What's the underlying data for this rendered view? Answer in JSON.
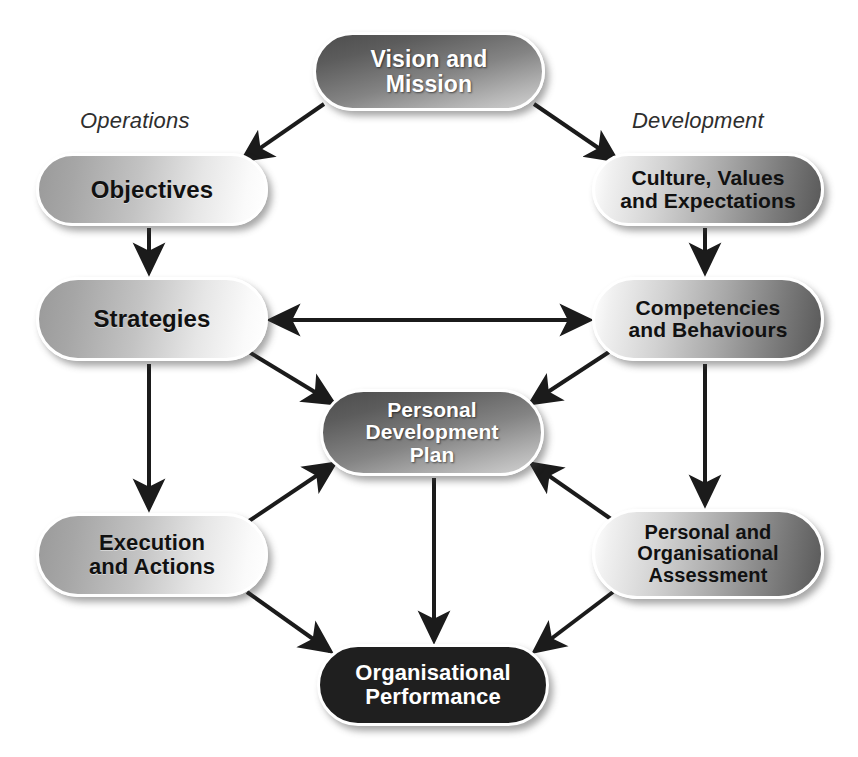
{
  "diagram": {
    "background_color": "#ffffff",
    "labels": {
      "left_column": "Operations",
      "right_column": "Development"
    },
    "nodes": [
      {
        "id": "vision_mission",
        "text": "Vision and\nMission",
        "style": "dark",
        "text_color": "#ffffff",
        "x": 313,
        "y": 32,
        "w": 232,
        "h": 79
      },
      {
        "id": "objectives",
        "text": "Objectives",
        "style": "light",
        "text_color": "#111111",
        "x": 36,
        "y": 153,
        "w": 232,
        "h": 73
      },
      {
        "id": "culture_values",
        "text": "Culture, Values\nand Expectations",
        "style": "light-dark",
        "text_color": "#111111",
        "x": 592,
        "y": 153,
        "w": 232,
        "h": 73
      },
      {
        "id": "strategies",
        "text": "Strategies",
        "style": "light",
        "text_color": "#111111",
        "x": 36,
        "y": 277,
        "w": 232,
        "h": 84
      },
      {
        "id": "competencies",
        "text": "Competencies\nand Behaviours",
        "style": "light-dark",
        "text_color": "#111111",
        "x": 592,
        "y": 277,
        "w": 232,
        "h": 84
      },
      {
        "id": "personal_development_plan",
        "text": "Personal\nDevelopment\nPlan",
        "style": "dark",
        "text_color": "#ffffff",
        "x": 320,
        "y": 389,
        "w": 224,
        "h": 87
      },
      {
        "id": "execution_actions",
        "text": "Execution\nand Actions",
        "style": "light",
        "text_color": "#111111",
        "x": 36,
        "y": 513,
        "w": 232,
        "h": 84
      },
      {
        "id": "personal_org_assessment",
        "text": "Personal and\nOrganisational\nAssessment",
        "style": "light-dark",
        "text_color": "#111111",
        "x": 592,
        "y": 509,
        "w": 232,
        "h": 90
      },
      {
        "id": "organisational_performance",
        "text": "Organisational\nPerformance",
        "style": "darkest",
        "text_color": "#ffffff",
        "x": 317,
        "y": 644,
        "w": 232,
        "h": 82
      }
    ],
    "edges": [
      {
        "id": "vision-to-objectives",
        "from": "vision_mission",
        "to": "objectives",
        "arrow": "single"
      },
      {
        "id": "vision-to-culture",
        "from": "vision_mission",
        "to": "culture_values",
        "arrow": "single"
      },
      {
        "id": "objectives-to-strategies",
        "from": "objectives",
        "to": "strategies",
        "arrow": "single"
      },
      {
        "id": "culture-to-competencies",
        "from": "culture_values",
        "to": "competencies",
        "arrow": "single"
      },
      {
        "id": "strategies-competencies",
        "from": "strategies",
        "to": "competencies",
        "arrow": "double"
      },
      {
        "id": "strategies-to-execution",
        "from": "strategies",
        "to": "execution_actions",
        "arrow": "single"
      },
      {
        "id": "strategies-to-pdp",
        "from": "strategies",
        "to": "personal_development_plan",
        "arrow": "single"
      },
      {
        "id": "competencies-to-pdp",
        "from": "competencies",
        "to": "personal_development_plan",
        "arrow": "single"
      },
      {
        "id": "competencies-to-assessment",
        "from": "competencies",
        "to": "personal_org_assessment",
        "arrow": "single"
      },
      {
        "id": "execution-to-pdp",
        "from": "execution_actions",
        "to": "personal_development_plan",
        "arrow": "single"
      },
      {
        "id": "assessment-to-pdp",
        "from": "personal_org_assessment",
        "to": "personal_development_plan",
        "arrow": "single"
      },
      {
        "id": "execution-to-performance",
        "from": "execution_actions",
        "to": "organisational_performance",
        "arrow": "single"
      },
      {
        "id": "pdp-to-performance",
        "from": "personal_development_plan",
        "to": "organisational_performance",
        "arrow": "single"
      },
      {
        "id": "assessment-to-performance",
        "from": "personal_org_assessment",
        "to": "organisational_performance",
        "arrow": "single"
      }
    ],
    "colors": {
      "line": "#1b1b1b",
      "label_text": "#2e2e2e",
      "dark_node_text": "#ffffff",
      "light_node_text": "#111111",
      "darkest_node_fill": "#1f1f1f"
    }
  }
}
